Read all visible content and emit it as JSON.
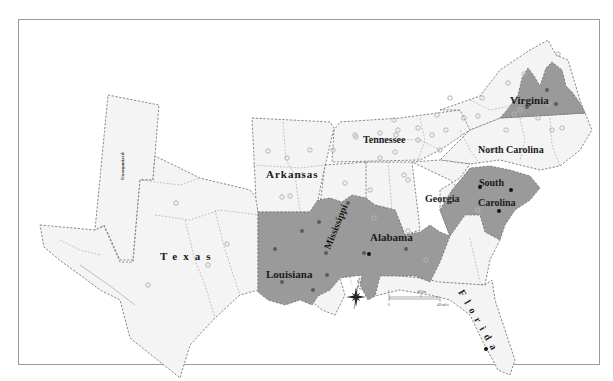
{
  "map": {
    "frame_color": "#9a9a9a",
    "colors": {
      "land": "#f4f4f4",
      "shaded": "#9a9a9a",
      "dot_open_stroke": "#b5b5b5",
      "dot_gray": "#5c5c5c",
      "dot_black": "#111111"
    },
    "labels": {
      "virginia": "Virginia",
      "tennessee": "Tennessee",
      "north_carolina": "North Carolina",
      "arkansas": "Arkansas",
      "south": "South",
      "carolina": "Carolina",
      "georgia": "Georgia",
      "mississippi": "Mississippi",
      "alabama": "Alabama",
      "texas": "Texas",
      "louisiana": "Louisiana",
      "florida": "Florida",
      "unorganized": "Unorganized"
    },
    "compass": {
      "north_label": "N"
    },
    "scale_bar": {
      "zero": "0",
      "km_label": "400 km",
      "miles_label": "400 miles"
    },
    "dots": {
      "open": [
        [
          558,
          54
        ],
        [
          524,
          74
        ],
        [
          508,
          83
        ],
        [
          482,
          98
        ],
        [
          478,
          116
        ],
        [
          514,
          114
        ],
        [
          538,
          118
        ],
        [
          506,
          130
        ],
        [
          562,
          128
        ],
        [
          464,
          118
        ],
        [
          418,
          140
        ],
        [
          432,
          135
        ],
        [
          440,
          150
        ],
        [
          396,
          135
        ],
        [
          395,
          152
        ],
        [
          398,
          130
        ],
        [
          404,
          175
        ],
        [
          408,
          180
        ],
        [
          380,
          158
        ],
        [
          355,
          135
        ],
        [
          345,
          183
        ],
        [
          370,
          190
        ],
        [
          310,
          150
        ],
        [
          333,
          150
        ],
        [
          268,
          151
        ],
        [
          287,
          158
        ],
        [
          302,
          175
        ],
        [
          290,
          196
        ],
        [
          380,
          133
        ],
        [
          394,
          120
        ],
        [
          418,
          128
        ],
        [
          437,
          115
        ],
        [
          446,
          130
        ],
        [
          450,
          98
        ],
        [
          340,
          218
        ],
        [
          374,
          218
        ],
        [
          282,
          197
        ],
        [
          176,
          203
        ],
        [
          208,
          265
        ],
        [
          148,
          285
        ],
        [
          227,
          244
        ],
        [
          408,
          231
        ],
        [
          426,
          260
        ],
        [
          356,
          137
        ],
        [
          478,
          210
        ],
        [
          520,
          110
        ],
        [
          548,
          104
        ],
        [
          495,
          150
        ],
        [
          552,
          130
        ]
      ],
      "gray": [
        [
          527,
          107
        ],
        [
          547,
          90
        ],
        [
          556,
          104
        ],
        [
          302,
          231
        ],
        [
          275,
          249
        ],
        [
          319,
          222
        ],
        [
          326,
          253
        ],
        [
          348,
          203
        ],
        [
          406,
          249
        ],
        [
          282,
          282
        ],
        [
          313,
          290
        ],
        [
          327,
          275
        ],
        [
          364,
          253
        ]
      ],
      "black": [
        [
          480,
          187
        ],
        [
          511,
          190
        ],
        [
          499,
          211
        ],
        [
          369,
          254
        ],
        [
          486,
          349
        ]
      ]
    }
  }
}
